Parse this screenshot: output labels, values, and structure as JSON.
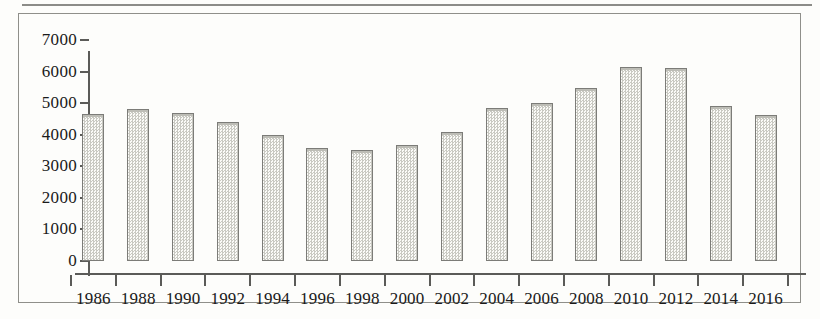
{
  "chart_data": {
    "type": "bar",
    "title": "",
    "subtitle": "",
    "xlabel": "",
    "ylabel": "",
    "categories": [
      "1986",
      "1988",
      "1990",
      "1992",
      "1994",
      "1996",
      "1998",
      "2000",
      "2002",
      "2004",
      "2006",
      "2008",
      "2010",
      "2012",
      "2014",
      "2016"
    ],
    "values": [
      4650,
      4800,
      4680,
      4400,
      4000,
      3580,
      3530,
      3680,
      4100,
      4850,
      5020,
      5480,
      6150,
      6110,
      4920,
      4620
    ],
    "series": [
      {
        "name": "",
        "values": [
          4650,
          4800,
          4680,
          4400,
          4000,
          3580,
          3530,
          3680,
          4100,
          4850,
          5020,
          5480,
          6150,
          6110,
          4920,
          4620
        ]
      }
    ],
    "ylim": [
      0,
      7000
    ],
    "y_ticks": [
      0,
      1000,
      2000,
      3000,
      4000,
      5000,
      6000,
      7000
    ],
    "y_tick_labels": [
      "0",
      "1000",
      "2000",
      "3000",
      "4000",
      "5000",
      "6000",
      "7000"
    ],
    "grid": false,
    "legend": false,
    "legend_position": "none",
    "annotations": [],
    "colors": {
      "bar_fill": "#e8e8e2",
      "bar_pattern": "#c9c9c2",
      "bar_border": "#7c7c78",
      "axis": "#5b5b58",
      "frame": "#8f8f8a",
      "text": "#1a1a1a",
      "background": "#fdfdfb"
    }
  }
}
